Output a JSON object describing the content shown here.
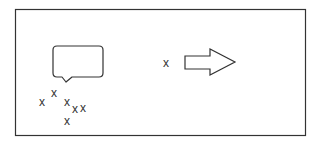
{
  "diagram": {
    "frame": {
      "stroke": "#333333"
    },
    "speech_bubble": {
      "stroke": "#333333",
      "text": ""
    },
    "cluster_marks": [
      {
        "label": "x",
        "x": 42,
        "y": 102
      },
      {
        "label": "x",
        "x": 54,
        "y": 93
      },
      {
        "label": "x",
        "x": 67,
        "y": 102
      },
      {
        "label": "x",
        "x": 75,
        "y": 109
      },
      {
        "label": "x",
        "x": 83,
        "y": 108
      },
      {
        "label": "x",
        "x": 67,
        "y": 121
      }
    ],
    "single_mark": {
      "label": "x",
      "x": 166,
      "y": 63
    },
    "arrow": {
      "direction": "right",
      "stroke": "#333333"
    }
  }
}
